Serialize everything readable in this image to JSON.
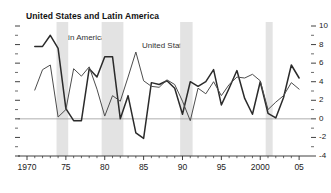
{
  "chart_data": {
    "type": "line",
    "title": "United States and Latin America",
    "xlabel": "",
    "ylabel": "",
    "xlim": [
      1970,
      2005.5
    ],
    "ylim": [
      -4,
      10
    ],
    "grid": false,
    "zero_line": 0,
    "legend_position": "inline-annotation",
    "y_ticks": [
      10,
      8,
      6,
      4,
      2,
      0,
      -2,
      -4
    ],
    "y_tick_labels": [
      "10",
      "8",
      "6",
      "4",
      "2",
      "0",
      "-2",
      "-4"
    ],
    "y_minor_ticks": [
      9,
      7,
      5,
      3,
      1,
      -1,
      -3
    ],
    "x_ticks": [
      1970,
      1975,
      1980,
      1985,
      1990,
      1995,
      2000,
      2005
    ],
    "x_tick_labels": [
      "1970",
      "75",
      "80",
      "85",
      "90",
      "95",
      "2000",
      "05"
    ],
    "x": [
      1971,
      1972,
      1973,
      1974,
      1975,
      1976,
      1977,
      1978,
      1979,
      1980,
      1981,
      1982,
      1983,
      1984,
      1985,
      1986,
      1987,
      1988,
      1989,
      1990,
      1991,
      1992,
      1993,
      1994,
      1995,
      1996,
      1997,
      1998,
      1999,
      2000,
      2001,
      2002,
      2003,
      2004,
      2005
    ],
    "series": [
      {
        "name": "Latin America",
        "color": "#2b2b2b",
        "width": 1.5,
        "values": [
          7.8,
          7.8,
          9.0,
          7.6,
          1.1,
          -0.2,
          -0.2,
          5.4,
          4.5,
          6.7,
          6.7,
          0.0,
          2.5,
          -1.5,
          -2.1,
          3.9,
          3.7,
          4.1,
          3.3,
          0.5,
          4.0,
          3.5,
          4.0,
          5.3,
          1.5,
          3.3,
          5.2,
          2.2,
          0.5,
          4.0,
          0.6,
          0.1,
          2.3,
          5.8,
          4.4
        ]
      },
      {
        "name": "United States",
        "color": "#4d4d4d",
        "width": 1.0,
        "values": [
          3.1,
          5.3,
          5.8,
          0.2,
          1.0,
          5.4,
          4.6,
          5.6,
          3.2,
          0.3,
          2.5,
          1.9,
          4.5,
          7.2,
          4.1,
          3.5,
          3.4,
          4.2,
          3.7,
          1.9,
          -0.2,
          3.3,
          2.7,
          4.0,
          2.5,
          3.7,
          4.5,
          4.4,
          4.8,
          4.1,
          1.0,
          1.8,
          2.5,
          3.9,
          3.2
        ]
      }
    ],
    "recession_bands": [
      {
        "start": 1973.8,
        "end": 1975.3
      },
      {
        "start": 1979.6,
        "end": 1982.4
      },
      {
        "start": 1989.7,
        "end": 1991.3
      },
      {
        "start": 2000.7,
        "end": 2001.6
      }
    ],
    "band_color": "#e3e3e3",
    "zero_line_color": "#9a9a9a",
    "axis_color": "#2b2b2b"
  }
}
